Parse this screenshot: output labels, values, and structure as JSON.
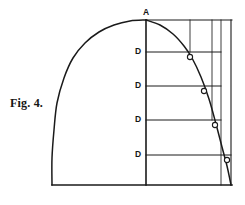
{
  "figure": {
    "caption": "Fig. 4.",
    "apex_label": "A",
    "ordinate_labels": [
      "D",
      "D",
      "D",
      "D"
    ],
    "point_marker_label": "O",
    "stroke_color": "#1a1a1a",
    "background_color": "#ffffff"
  },
  "chart_data": {
    "type": "line",
    "title": "Fig. 4.",
    "xlabel": "",
    "ylabel": "",
    "grid": false,
    "legend": null,
    "xlim": [
      52,
      232
    ],
    "ylim": [
      185,
      20
    ],
    "axis_vertical_x": 146,
    "axis_top_y": 20,
    "axis_bottom_y": 185,
    "baseline": {
      "x1": 52,
      "y1": 185,
      "x2": 232,
      "y2": 185
    },
    "top_line": {
      "x1": 146,
      "y1": 20,
      "x2": 232,
      "y2": 20
    },
    "apex": {
      "x": 146,
      "y": 20,
      "label": "A"
    },
    "curve_left": [
      [
        146,
        20
      ],
      [
        130,
        21
      ],
      [
        114,
        25
      ],
      [
        99,
        32
      ],
      [
        85,
        43
      ],
      [
        73,
        58
      ],
      [
        64,
        78
      ],
      [
        57,
        103
      ],
      [
        54,
        130
      ],
      [
        52,
        158
      ],
      [
        52,
        185
      ]
    ],
    "curve_right": [
      [
        146,
        20
      ],
      [
        160,
        25
      ],
      [
        173,
        34
      ],
      [
        184,
        46
      ],
      [
        192,
        58
      ],
      [
        201,
        77
      ],
      [
        209,
        99
      ],
      [
        216,
        124
      ],
      [
        222,
        147
      ],
      [
        227,
        166
      ],
      [
        230,
        180
      ],
      [
        231,
        185
      ]
    ],
    "ordinates": [
      {
        "label": "D",
        "y": 52,
        "x_axis": 146,
        "x_curve": 190,
        "marker": "O",
        "marker_x": 190,
        "marker_y": 57
      },
      {
        "label": "D",
        "y": 86,
        "x_axis": 146,
        "x_curve": 204,
        "marker": "O",
        "marker_x": 204,
        "marker_y": 91
      },
      {
        "label": "D",
        "y": 120,
        "x_axis": 146,
        "x_curve": 215,
        "marker": "O",
        "marker_x": 215,
        "marker_y": 125
      },
      {
        "label": "D",
        "y": 155,
        "x_axis": 146,
        "x_curve": 227,
        "marker": "O",
        "marker_x": 227,
        "marker_y": 160
      }
    ],
    "verticals": [
      {
        "x": 190,
        "y_top": 20,
        "y_bottom": 52
      },
      {
        "x": 212,
        "y_top": 20,
        "y_bottom": 120
      },
      {
        "x": 221,
        "y_top": 20,
        "y_bottom": 185
      },
      {
        "x": 231,
        "y_top": 20,
        "y_bottom": 185
      }
    ]
  }
}
